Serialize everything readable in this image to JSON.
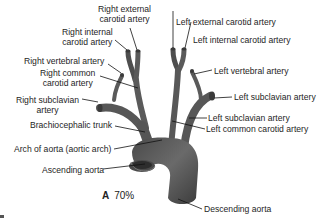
{
  "figure": {
    "panel_letter": "A",
    "zoom_percent": "70%",
    "colors": {
      "vessel_fill": "#5c5c5c",
      "vessel_highlight": "#8a8a8a",
      "vessel_dark": "#3a3a3a",
      "leader_line": "#111111",
      "label_text": "#1e1e1e"
    }
  },
  "labels": {
    "right_external_carotid": [
      "Right external",
      "carotid artery"
    ],
    "right_internal_carotid": [
      "Right internal",
      "carotid artery"
    ],
    "right_vertebral": "Right vertebral artery",
    "right_common_carotid": [
      "Right common",
      "carotid artery"
    ],
    "right_subclavian": [
      "Right subclavian",
      "artery"
    ],
    "brachiocephalic_trunk": "Brachiocephalic trunk",
    "arch_of_aorta": "Arch of aorta (aortic arch)",
    "ascending_aorta": "Ascending aorta",
    "left_external_carotid": "Left external carotid artery",
    "left_internal_carotid": "Left internal carotid artery",
    "left_vertebral": "Left vertebral artery",
    "left_subclavian_upper": "Left subclavian artery",
    "left_subclavian_lower": "Left subclavian artery",
    "left_common_carotid": "Left common carotid artery",
    "descending_aorta": "Descending aorta"
  }
}
